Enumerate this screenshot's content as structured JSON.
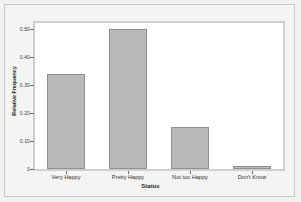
{
  "chart_data": {
    "type": "bar",
    "title": "",
    "subtitle": "",
    "xlabel": "Status",
    "ylabel": "Relative Frequency",
    "categories": [
      "Very Happy",
      "Pretty Happy",
      "Not too Happy",
      "Don't Know"
    ],
    "values": [
      0.34,
      0.5,
      0.15,
      0.01
    ],
    "ylim": [
      0,
      0.52
    ],
    "yticks": [
      0,
      0.1,
      0.2,
      0.3,
      0.4,
      0.5
    ],
    "ytick_labels": [
      "0",
      "0.10",
      "0.20",
      "0.30",
      "0.40",
      "0.50"
    ],
    "grid": false,
    "legend": false,
    "legend_position": "none",
    "bar_color": "#b9b9b9",
    "bar_edge_color": "#8f8f8f",
    "plot_background": "#ffffff",
    "figure_background": "#f4f4f2",
    "frame_color": "#cfcfcf"
  }
}
